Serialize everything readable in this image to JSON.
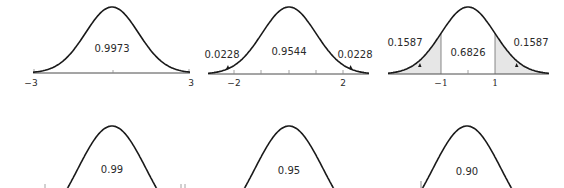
{
  "chart_data": [
    {
      "type": "area",
      "title": "",
      "distribution": "standard normal",
      "center_label": "0.9973",
      "interval": [
        -3,
        3
      ],
      "tick_labels": [
        "−3",
        "3"
      ],
      "tail_labels": [],
      "shaded_tails": false
    },
    {
      "type": "area",
      "title": "",
      "distribution": "standard normal",
      "center_label": "0.9544",
      "interval": [
        -2,
        2
      ],
      "tick_labels": [
        "−2",
        "2"
      ],
      "tail_labels": [
        "0.0228",
        "0.0228"
      ],
      "shaded_tails": false
    },
    {
      "type": "area",
      "title": "",
      "distribution": "standard normal",
      "center_label": "0.6826",
      "interval": [
        -1,
        1
      ],
      "tick_labels": [
        "−1",
        "1"
      ],
      "tail_labels": [
        "0.1587",
        "0.1587"
      ],
      "shaded_tails": true
    },
    {
      "type": "area",
      "distribution": "standard normal",
      "center_label": "0.99",
      "note": "bottom of figure cropped"
    },
    {
      "type": "area",
      "distribution": "standard normal",
      "center_label": "0.95",
      "note": "bottom of figure cropped"
    },
    {
      "type": "area",
      "distribution": "standard normal",
      "center_label": "0.90",
      "note": "bottom of figure cropped"
    }
  ],
  "panels": {
    "p1": {
      "center": "0.9973",
      "left_tick": "−3",
      "right_tick": "3"
    },
    "p2": {
      "center": "0.9544",
      "left_tail": "0.0228",
      "right_tail": "0.0228",
      "left_tick": "−2",
      "right_tick": "2"
    },
    "p3": {
      "center": "0.6826",
      "left_tail": "0.1587",
      "right_tail": "0.1587",
      "left_tick": "−1",
      "right_tick": "1"
    },
    "p4": {
      "center": "0.99"
    },
    "p5": {
      "center": "0.95"
    },
    "p6": {
      "center": "0.90"
    }
  }
}
